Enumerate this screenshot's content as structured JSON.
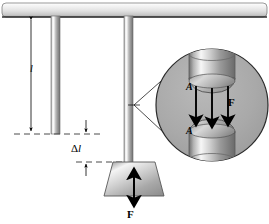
{
  "figure": {
    "background_color": "#ffffff",
    "width": 269,
    "height": 224
  },
  "labels": {
    "length_l": "l",
    "delta_l_symbol": "Δ",
    "delta_l_var": "l",
    "force_bottom": "F",
    "force_circle": "F",
    "area_top": "A",
    "area_bottom": "A"
  },
  "colors": {
    "ceiling_light": "#f2f2f2",
    "ceiling_mid": "#d8d8d8",
    "ceiling_dark": "#9a9a9a",
    "ceiling_edge": "#3c3c3c",
    "rod_light": "#f4f4f4",
    "rod_mid": "#a9a9a9",
    "rod_dark": "#6d6d6d",
    "circle_fill": "#a8a8a8",
    "circle_stroke": "#2a2a2a",
    "weight_light": "#efefef",
    "weight_mid": "#b5b5b5",
    "weight_dark": "#8a8a8a",
    "line": "#000000",
    "dashed": "#5a5a5a"
  },
  "geometry": {
    "ceiling": {
      "x": 2,
      "y": 3,
      "width": 265,
      "height": 14
    },
    "rod_short": {
      "x": 51,
      "y": 16,
      "width": 9,
      "height": 118
    },
    "rod_long": {
      "x": 124,
      "y": 16,
      "width": 9,
      "height": 177
    },
    "weight": {
      "top_y": 162,
      "bottom_y": 196,
      "top_left": 113,
      "top_right": 155,
      "bottom_left": 104,
      "bottom_right": 164
    },
    "magnifier_circle": {
      "cx": 212,
      "cy": 105,
      "r": 56
    },
    "dimension_l": {
      "x": 31,
      "y_top": 17,
      "y_bottom": 134
    },
    "dimension_delta_l": {
      "x": 86,
      "y_top": 134,
      "y_bottom": 162
    },
    "arrow_count_in_circle": 3
  },
  "annotations": {
    "dashed_line_upper": "horizontal dashed reference at unstretched rod end",
    "dashed_line_lower": "horizontal dashed reference at stretched rod end",
    "leader_lines": "two lines from rod to magnifier circle",
    "arrows_in_circle": "three downward force arrows between upper and lower cylinder faces"
  }
}
